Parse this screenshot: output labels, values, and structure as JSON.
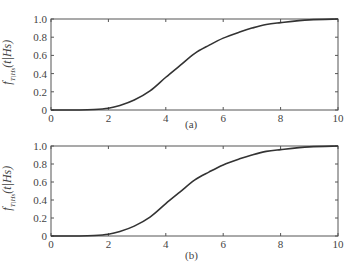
{
  "chart_data": [
    {
      "type": "line",
      "panel_label": "(a)",
      "ylabel_main": "f",
      "ylabel_sub": "T|H_s",
      "ylabel_args": "(t|H_s)",
      "xlabel": "",
      "xlim": [
        0,
        10
      ],
      "ylim": [
        0,
        1.0
      ],
      "xticks": [
        "0",
        "2",
        "4",
        "6",
        "8",
        "10"
      ],
      "yticks": [
        "0",
        "0.2",
        "0.4",
        "0.6",
        "0.8",
        "1.0"
      ],
      "grid": false,
      "series": [
        {
          "name": "curve",
          "color": "#333333",
          "x": [
            0,
            1,
            1.5,
            2.0,
            2.4,
            2.9,
            3.45,
            4.0,
            4.5,
            5.0,
            5.5,
            6.0,
            6.6,
            7.0,
            7.5,
            8.0,
            9.0,
            10.0
          ],
          "y": [
            0,
            0.0,
            0.005,
            0.02,
            0.05,
            0.11,
            0.21,
            0.36,
            0.49,
            0.62,
            0.71,
            0.79,
            0.86,
            0.9,
            0.94,
            0.96,
            0.99,
            1.0
          ]
        }
      ]
    },
    {
      "type": "line",
      "panel_label": "(b)",
      "ylabel_main": "f",
      "ylabel_sub": "T|H_s",
      "ylabel_args": "(t|H_s)",
      "xlabel": "",
      "xlim": [
        0,
        10
      ],
      "ylim": [
        0,
        1.0
      ],
      "xticks": [
        "0",
        "2",
        "4",
        "6",
        "8",
        "10"
      ],
      "yticks": [
        "0",
        "0.2",
        "0.4",
        "0.6",
        "0.8",
        "1.0"
      ],
      "grid": false,
      "series": [
        {
          "name": "curve",
          "color": "#333333",
          "x": [
            0,
            1,
            1.5,
            2.0,
            2.4,
            2.9,
            3.45,
            4.0,
            4.5,
            5.0,
            5.5,
            6.0,
            6.6,
            7.0,
            7.5,
            8.0,
            9.0,
            10.0
          ],
          "y": [
            0,
            0.0,
            0.005,
            0.02,
            0.05,
            0.11,
            0.21,
            0.36,
            0.49,
            0.62,
            0.71,
            0.79,
            0.86,
            0.9,
            0.94,
            0.96,
            0.99,
            1.0
          ]
        }
      ]
    }
  ],
  "labels": {
    "a": {
      "caption": "(a)",
      "ylabel_f": "f",
      "ylabel_sub": "T|Hs",
      "ylabel_args": "(t|Hs)"
    },
    "b": {
      "caption": "(b)",
      "ylabel_f": "f",
      "ylabel_sub": "T|Hs",
      "ylabel_args": "(t|Hs)"
    }
  }
}
